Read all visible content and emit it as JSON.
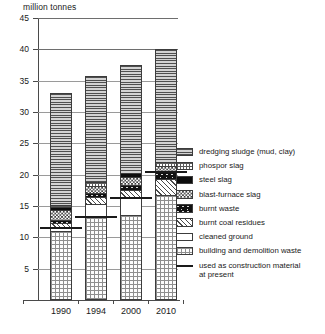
{
  "chart_data": {
    "type": "bar",
    "subtype": "stacked-bar",
    "title": "",
    "axis_unit_label": "million tonnes",
    "xlabel": "",
    "ylabel": "million tonnes",
    "ylim": [
      0,
      45
    ],
    "ytick_values": [
      5,
      10,
      15,
      20,
      25,
      30,
      35,
      40,
      45
    ],
    "ytick_labels": [
      "5",
      "10",
      "15",
      "20",
      "25",
      "30",
      "35",
      "40",
      "45"
    ],
    "grid": true,
    "legend_position": "right",
    "categories": [
      "1990",
      "1994",
      "2000",
      "2010"
    ],
    "totals": [
      33.0,
      35.8,
      37.5,
      40.0
    ],
    "series": [
      {
        "name": "building and demolition waste",
        "pattern": "sparse-dots",
        "values": [
          11.0,
          13.2,
          13.6,
          16.7
        ]
      },
      {
        "name": "cleaned ground",
        "pattern": "white",
        "values": [
          0.5,
          2.1,
          2.7,
          0.0
        ]
      },
      {
        "name": "burnt coal residues",
        "pattern": "diagonal-hatch",
        "values": [
          0.8,
          1.2,
          1.2,
          2.6
        ]
      },
      {
        "name": "burnt waste",
        "pattern": "black-speckled",
        "values": [
          0.5,
          0.5,
          0.9,
          1.2
        ]
      },
      {
        "name": "blast-furnace slag",
        "pattern": "checkerboard",
        "values": [
          1.5,
          1.2,
          1.2,
          0.9
        ]
      },
      {
        "name": "steel slag",
        "pattern": "solid-black",
        "values": [
          0.5,
          0.0,
          0.7,
          0.0
        ]
      },
      {
        "name": "phospor slag",
        "pattern": "fine-grid-dots",
        "values": [
          0.4,
          0.7,
          0.0,
          0.7
        ]
      },
      {
        "name": "dredging sludge (mud, clay)",
        "pattern": "horizontal-lines",
        "values": [
          17.8,
          16.9,
          17.2,
          17.9
        ]
      }
    ],
    "construction_material_marker": {
      "label": "used as construction material at present",
      "values": [
        11.5,
        13.2,
        16.3,
        20.5
      ]
    }
  },
  "legend": {
    "items": [
      {
        "label": "dredging sludge (mud, clay)",
        "swatch": "horizontal-lines"
      },
      {
        "label": "phospor slag",
        "swatch": "fine-grid-dots"
      },
      {
        "label": "steel slag",
        "swatch": "solid-black"
      },
      {
        "label": "blast-furnace slag",
        "swatch": "checkerboard"
      },
      {
        "label": "burnt waste",
        "swatch": "black-speckled"
      },
      {
        "label": "burnt coal residues",
        "swatch": "diagonal-hatch"
      },
      {
        "label": "cleaned ground",
        "swatch": "white"
      },
      {
        "label": "building and demolition waste",
        "swatch": "sparse-dots"
      },
      {
        "label": "used as construction material\nat present",
        "swatch": "rule"
      }
    ]
  }
}
